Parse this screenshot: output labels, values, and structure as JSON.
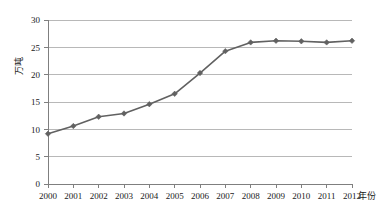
{
  "chart_data": {
    "type": "line",
    "title": "",
    "subtitle": "",
    "xlabel": "年份",
    "ylabel": "万吨",
    "x": [
      2000,
      2001,
      2002,
      2003,
      2004,
      2005,
      2006,
      2007,
      2008,
      2009,
      2010,
      2011,
      2012
    ],
    "categories": [
      "2000",
      "2001",
      "2002",
      "2003",
      "2004",
      "2005",
      "2006",
      "2007",
      "2008",
      "2009",
      "2010",
      "2011",
      "2012"
    ],
    "values": [
      9.2,
      10.6,
      12.3,
      12.9,
      14.6,
      16.5,
      20.3,
      24.3,
      25.9,
      26.2,
      26.1,
      25.9,
      26.2
    ],
    "series": [
      {
        "name": "",
        "values": [
          9.2,
          10.6,
          12.3,
          12.9,
          14.6,
          16.5,
          20.3,
          24.3,
          25.9,
          26.2,
          26.1,
          25.9,
          26.2
        ]
      }
    ],
    "xlim": [
      2000,
      2012
    ],
    "ylim": [
      0,
      30
    ],
    "ytick_labels": [
      "0",
      "5",
      "10",
      "15",
      "20",
      "25",
      "30"
    ],
    "ytick_values": [
      0,
      5,
      10,
      15,
      20,
      25,
      30
    ],
    "grid": "horizontal",
    "legend": "none",
    "line_color": "#616161",
    "marker": "diamond",
    "marker_color": "#616161",
    "gridline_color": "#b8b8b8",
    "axis_color": "#7f7f7f",
    "background_color": "#ffffff"
  }
}
